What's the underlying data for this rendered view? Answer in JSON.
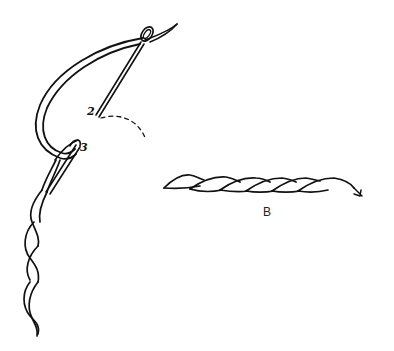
{
  "illustration": {
    "description": "Embroidery stem/outline stitch diagram",
    "labels": {
      "point_2": "2",
      "point_3": "3",
      "figure_caption": "B"
    },
    "colors": {
      "ink": "#111111",
      "background": "#ffffff"
    }
  }
}
